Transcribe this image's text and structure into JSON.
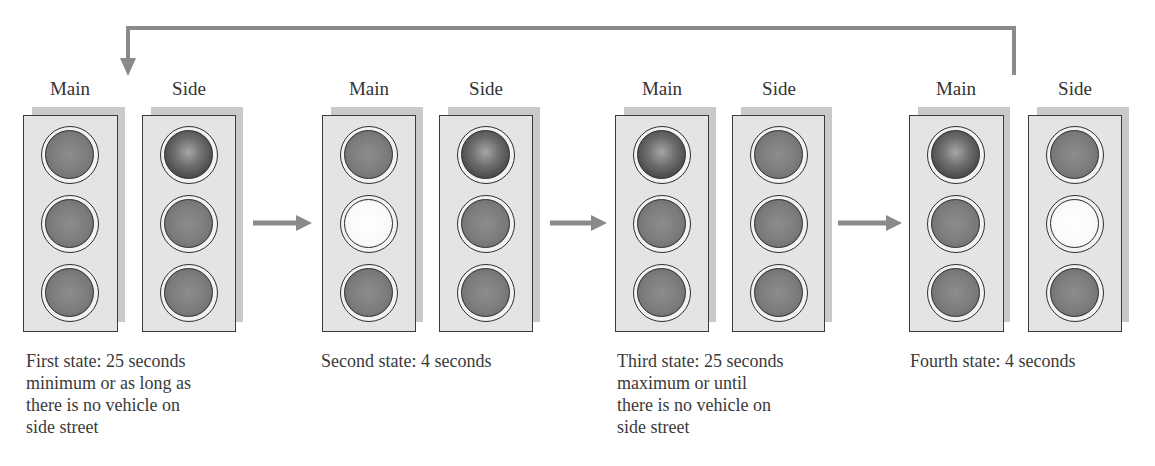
{
  "diagram": {
    "type": "traffic-light-state-sequence",
    "signal_labels": {
      "main": "Main",
      "side": "Side"
    },
    "colors": {
      "arrow": "#8a8a8a",
      "housing_fill": "#e4e4e4",
      "housing_shadow": "#c9c9c9",
      "housing_border": "#3b3b3b",
      "lamp_off": "#7c7c7c",
      "lamp_on_dark": "#3e3e3e",
      "lamp_on_bright": "#fafafa"
    },
    "states": [
      {
        "caption": "First state: 25 seconds\nminimum or as long as\nthere is no vehicle on\nside street",
        "main": [
          "off",
          "off",
          "off"
        ],
        "side": [
          "on-dark",
          "off",
          "off"
        ]
      },
      {
        "caption": "Second state: 4 seconds",
        "main": [
          "off",
          "on-bright",
          "off"
        ],
        "side": [
          "on-dark",
          "off",
          "off"
        ]
      },
      {
        "caption": "Third state: 25 seconds\nmaximum or until\nthere is no vehicle on\nside street",
        "main": [
          "on-dark",
          "off",
          "off"
        ],
        "side": [
          "off",
          "off",
          "off"
        ]
      },
      {
        "caption": "Fourth state: 4 seconds",
        "main": [
          "on-dark",
          "off",
          "off"
        ],
        "side": [
          "off",
          "on-bright",
          "off"
        ]
      }
    ],
    "transitions": [
      {
        "from": 1,
        "to": 2
      },
      {
        "from": 2,
        "to": 3
      },
      {
        "from": 3,
        "to": 4
      },
      {
        "from": 4,
        "to": 1
      }
    ]
  }
}
